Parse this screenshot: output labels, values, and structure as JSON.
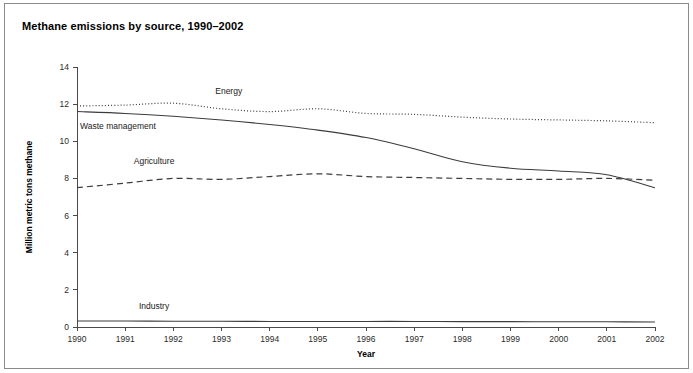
{
  "chart_data": {
    "type": "line",
    "title": "Methane emissions by source, 1990–2002",
    "xlabel": "Year",
    "ylabel": "Million metric tons methane",
    "x": [
      1990,
      1991,
      1992,
      1993,
      1994,
      1995,
      1996,
      1997,
      1998,
      1999,
      2000,
      2001,
      2002
    ],
    "xlim": [
      1990,
      2002
    ],
    "ylim": [
      0,
      14
    ],
    "yticks": [
      0,
      2,
      4,
      6,
      8,
      10,
      12,
      14
    ],
    "xticks": [
      "1990",
      "1991",
      "1992",
      "1993",
      "1994",
      "1995",
      "1996",
      "1997",
      "1998",
      "1999",
      "2000",
      "2001",
      "2002"
    ],
    "ytick_labels": [
      "0",
      "2",
      "4",
      "6",
      "8",
      "10",
      "12",
      "14"
    ],
    "grid": false,
    "legend_position": "inline-labels",
    "series": [
      {
        "name": "Energy",
        "style": "dotted",
        "color": "#3c3c3c",
        "label_x": 1993.15,
        "label_y": 12.55,
        "values": [
          11.9,
          11.95,
          12.05,
          11.75,
          11.6,
          11.75,
          11.5,
          11.45,
          11.3,
          11.2,
          11.15,
          11.1,
          11.0
        ]
      },
      {
        "name": "Waste management",
        "style": "solid",
        "color": "#3c3c3c",
        "label_x": 1990.85,
        "label_y": 10.65,
        "values": [
          11.6,
          11.5,
          11.35,
          11.15,
          10.9,
          10.6,
          10.2,
          9.6,
          8.9,
          8.55,
          8.4,
          8.2,
          7.5
        ]
      },
      {
        "name": "Agriculture",
        "style": "dashed",
        "color": "#3c3c3c",
        "label_x": 1991.6,
        "label_y": 8.8,
        "values": [
          7.5,
          7.75,
          8.0,
          7.95,
          8.1,
          8.25,
          8.1,
          8.05,
          8.0,
          7.95,
          7.95,
          8.0,
          7.9
        ]
      },
      {
        "name": "Industry",
        "style": "solid",
        "color": "#7a7a7a",
        "label_x": 1991.6,
        "label_y": 0.95,
        "values": [
          0.32,
          0.32,
          0.31,
          0.31,
          0.3,
          0.3,
          0.3,
          0.3,
          0.29,
          0.29,
          0.28,
          0.28,
          0.27
        ]
      }
    ]
  }
}
